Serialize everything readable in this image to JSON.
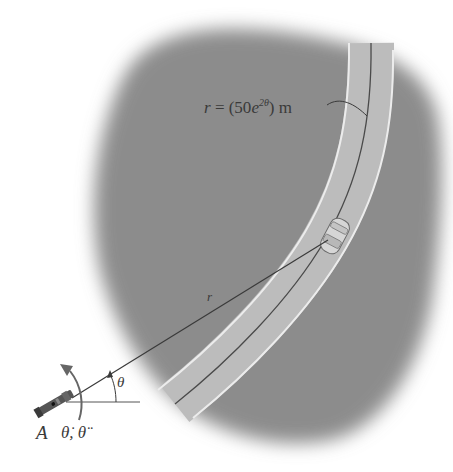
{
  "figure": {
    "type": "engineering-dynamics-diagram"
  },
  "labels": {
    "path_equation_prefix": "r = (50",
    "path_equation_e": "e",
    "path_equation_exponent": "2θ",
    "path_equation_suffix": ") m",
    "radial_distance": "r",
    "angle": "θ",
    "origin_point": "A",
    "angular_rates": "θ̇, θ̈"
  },
  "colors": {
    "terrain": "#8a8a8a",
    "road_surface": "#bdbdbd",
    "road_edge": "#e8e8e8",
    "lane_line": "#444444",
    "line": "#3a3a3a",
    "background": "#ffffff"
  }
}
